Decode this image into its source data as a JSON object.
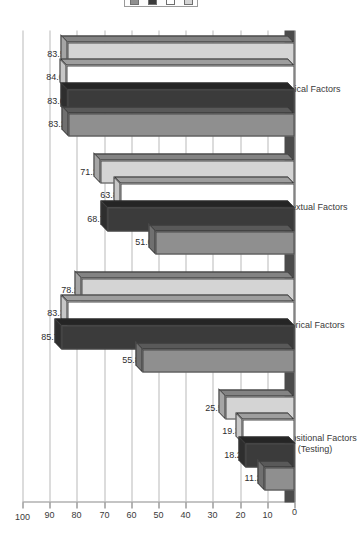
{
  "chart_data": {
    "type": "bar",
    "orientation": "horizontal-3d",
    "title": "",
    "xlabel": "",
    "ylabel": "",
    "ylim": [
      0,
      100
    ],
    "ticks": [
      "0",
      "10",
      "20",
      "30",
      "40",
      "50",
      "60",
      "70",
      "80",
      "90",
      "100"
    ],
    "grid": true,
    "legend_position": "top",
    "categories": [
      "Dispositional Factors\n(Testing)",
      "Historical Factors",
      "Contextual Factors",
      "Clinical Factors"
    ],
    "series": [
      {
        "name": "series-1",
        "color": "#8f8f8f",
        "values": [
          11.2,
          55.8,
          51.0,
          83.2
        ]
      },
      {
        "name": "series-2",
        "color": "#3b3b3b",
        "values": [
          18.2,
          85.7,
          68.7,
          83.6
        ]
      },
      {
        "name": "series-3",
        "color": "#ffffff",
        "values": [
          19.3,
          83.3,
          63.8,
          84.0
        ]
      },
      {
        "name": "series-4",
        "color": "#d4d4d4",
        "values": [
          25.5,
          78.2,
          71.2,
          83.5
        ]
      }
    ],
    "data_labels": [
      [
        "11.2",
        "18.2",
        "19.3",
        "25.5"
      ],
      [
        "55.8",
        "85.7",
        "83.3",
        "78.2"
      ],
      [
        "51.0",
        "68.7",
        "63.8",
        "71.2"
      ],
      [
        "83.2",
        "83.6",
        "84.0",
        "83.5"
      ]
    ]
  },
  "legend": {
    "items": [
      {
        "name": "legend-swatch-1",
        "color": "#8f8f8f"
      },
      {
        "name": "legend-swatch-2",
        "color": "#3b3b3b"
      },
      {
        "name": "legend-swatch-3",
        "color": "#ffffff"
      },
      {
        "name": "legend-swatch-4",
        "color": "#d4d4d4"
      }
    ]
  },
  "colors": {
    "axis": "#555555",
    "grid": "#b9b9b9",
    "text": "#3a3a3a",
    "floor": "#4b4b4b",
    "bar_outline": "#4a4a4a"
  }
}
